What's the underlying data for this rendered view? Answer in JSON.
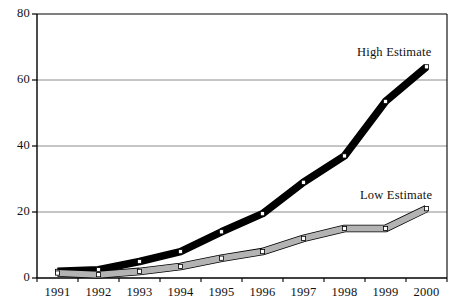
{
  "chart_data": {
    "type": "line",
    "title": "",
    "subtitle": "",
    "xlabel": "",
    "ylabel": "",
    "categories": [
      "1991",
      "1992",
      "1993",
      "1994",
      "1995",
      "1996",
      "1997",
      "1998",
      "1999",
      "2000"
    ],
    "x": [
      1991,
      1992,
      1993,
      1994,
      1995,
      1996,
      1997,
      1998,
      1999,
      2000
    ],
    "series": [
      {
        "name": "High Estimate",
        "values": [
          2,
          2.5,
          5,
          8,
          14,
          19.5,
          29,
          37,
          53.5,
          64
        ],
        "color": "#000000",
        "marker": "square-open",
        "line_width": 6
      },
      {
        "name": "Low Estimate",
        "values": [
          1.5,
          1,
          2,
          3.5,
          6,
          8,
          12,
          15,
          15,
          21
        ],
        "color": "#b3b3b3",
        "marker": "square-open",
        "line_width": 6
      }
    ],
    "ylim": [
      0,
      80
    ],
    "yticks": [
      "0",
      "20",
      "40",
      "60",
      "80"
    ],
    "ytick_values": [
      0,
      20,
      40,
      60,
      80
    ],
    "grid": "horizontal",
    "legend_position": "inline-annotation",
    "annotations": [
      {
        "text": "High Estimate",
        "series": "High Estimate"
      },
      {
        "text": "Low Estimate",
        "series": "Low Estimate"
      }
    ],
    "axis_color": "#000000",
    "grid_color": "#7f7f7f",
    "background": "#ffffff"
  }
}
